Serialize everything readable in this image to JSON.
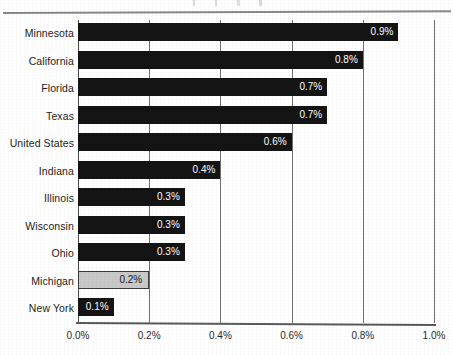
{
  "figure": {
    "title": "",
    "title_visible": false,
    "note": "title cropped off top of page"
  },
  "chart_data": {
    "type": "bar",
    "orientation": "horizontal",
    "title": "",
    "xlabel": "",
    "ylabel": "",
    "xlim": [
      0.0,
      1.0
    ],
    "xtick_labels": [
      "0.0%",
      "0.2%",
      "0.4%",
      "0.6%",
      "0.8%",
      "1.0%"
    ],
    "xticks": [
      0.0,
      0.2,
      0.4,
      0.6,
      0.8,
      1.0
    ],
    "grid": true,
    "grid_axis": "x",
    "legend": null,
    "categories": [
      "Minnesota",
      "California",
      "Florida",
      "Texas",
      "United States",
      "Indiana",
      "Illinois",
      "Wisconsin",
      "Ohio",
      "Michigan",
      "New York"
    ],
    "values": [
      0.9,
      0.8,
      0.7,
      0.7,
      0.6,
      0.4,
      0.3,
      0.3,
      0.3,
      0.2,
      0.1
    ],
    "value_labels": [
      "0.9%",
      "0.8%",
      "0.7%",
      "0.7%",
      "0.6%",
      "0.4%",
      "0.3%",
      "0.3%",
      "0.3%",
      "0.2%",
      "0.1%"
    ],
    "highlight_category": "Michigan",
    "colors": {
      "bar": "#141414",
      "bar_highlight": "#c9c9c9",
      "bar_highlight_border": "#3a3a3a",
      "value_label": "#ffffff",
      "value_label_highlight": "#161616",
      "gridline": "#6f6f6f",
      "axis": "#5a5a5a",
      "background": "#ffffff"
    }
  }
}
